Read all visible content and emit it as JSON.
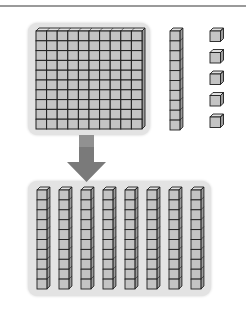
{
  "diagram": {
    "type": "base-ten-blocks-regrouping",
    "colors": {
      "block_fill": "#c4c4c4",
      "block_top": "#e0e0e0",
      "block_side": "#9c9c9c",
      "block_stroke": "#1e1e1e",
      "panel_bg": "#e3e3e3",
      "arrow": "#7a7a7a",
      "rule": "#9a9a9a"
    },
    "top_group": {
      "hundreds_flat": {
        "count": 1,
        "grid": [
          10,
          10
        ]
      },
      "ten_rods": {
        "count": 1,
        "cubes_per_rod": 10
      },
      "unit_cubes": {
        "count": 5
      }
    },
    "arrow": {
      "direction": "down"
    },
    "bottom_group": {
      "ten_rods": {
        "count": 8,
        "cubes_per_rod": 10
      }
    }
  }
}
